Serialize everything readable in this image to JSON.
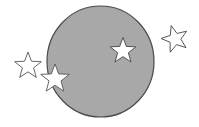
{
  "figure": {
    "background": "#ffffff",
    "circle": {
      "cx": 100.5,
      "cy": 61.5,
      "rx": 53.5,
      "ry": 55.5,
      "fill": "#a8a8a8",
      "stroke": "#4a4a4a",
      "stroke_width": 1.2
    },
    "stars": [
      {
        "id": "star-outside-left",
        "cx": 28,
        "cy": 66,
        "r": 14,
        "rotation": 0,
        "fill": "#ffffff",
        "stroke": "#555555"
      },
      {
        "id": "star-on-edge-left",
        "cx": 55,
        "cy": 79,
        "r": 15,
        "rotation": 0,
        "fill": "#ffffff",
        "stroke": "#555555"
      },
      {
        "id": "star-inside",
        "cx": 123,
        "cy": 51,
        "r": 13.5,
        "rotation": 0,
        "fill": "#ffffff",
        "stroke": "#444444"
      },
      {
        "id": "star-outside-right",
        "cx": 175,
        "cy": 39,
        "r": 14,
        "rotation": 200,
        "fill": "#ffffff",
        "stroke": "#555555"
      }
    ]
  }
}
